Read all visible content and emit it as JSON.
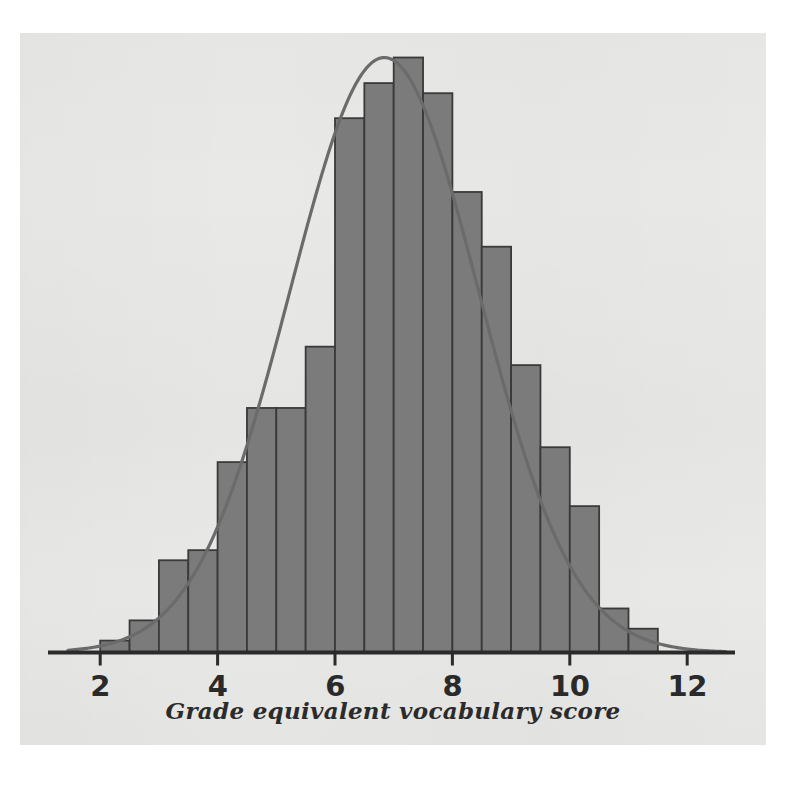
{
  "chart_data": {
    "type": "bar",
    "title": "",
    "subtitle": "",
    "xlabel": "Grade equivalent vocabulary score",
    "ylabel": "",
    "grid": false,
    "legend": null,
    "xlim": [
      1.45,
      12.6
    ],
    "ylim": [
      0,
      0.345
    ],
    "bin_width": 0.5,
    "x_ticks": [
      2,
      4,
      6,
      8,
      10,
      12
    ],
    "x_tick_labels": [
      "2",
      "4",
      "6",
      "8",
      "10",
      "12"
    ],
    "y_axis_visible": false,
    "bar_fill": "#7b7b7b",
    "bar_edge": "#3a3a3a",
    "curve_color": "#6b6b6b",
    "axis_color": "#2b2b2b",
    "plate_background": "#e9e9e7",
    "page_background": "#ffffff",
    "categories": [
      "2.0-2.5",
      "2.5-3.0",
      "3.0-3.5",
      "3.5-4.0",
      "4.0-4.5",
      "4.5-5.0",
      "5.0-5.5",
      "5.5-6.0",
      "6.0-6.5",
      "6.5-7.0",
      "7.0-7.5",
      "7.5-8.0",
      "8.0-8.5",
      "8.5-9.0",
      "9.0-9.5",
      "9.5-10.0",
      "10.0-10.5",
      "10.5-11.0",
      "11.0-11.5"
    ],
    "bin_edges": [
      2.0,
      2.5,
      3.0,
      3.5,
      4.0,
      4.5,
      5.0,
      5.5,
      6.0,
      6.5,
      7.0,
      7.5,
      8.0,
      8.5,
      9.0,
      9.5,
      10.0,
      10.5,
      11.0,
      11.5
    ],
    "values": [
      0.02,
      0.054,
      0.155,
      0.172,
      0.32,
      0.411,
      0.411,
      0.514,
      0.898,
      0.957,
      1.0,
      0.94,
      0.774,
      0.682,
      0.483,
      0.345,
      0.246,
      0.074,
      0.04
    ],
    "values_note": "bar heights normalized to tallest bin (6.5-7.0) = 1.000",
    "bar_heights_px": [
      12,
      32,
      92,
      102,
      190,
      244,
      244,
      305,
      534,
      569,
      595,
      559,
      460,
      405,
      287,
      205,
      146,
      44,
      24
    ],
    "overlay_curve": {
      "name": "normal-density-curve",
      "kind": "line",
      "mean": 6.84,
      "sigma": 1.61,
      "peak_value": 1.0,
      "description": "smooth bell-shaped normal curve fitted over the histogram"
    },
    "annotations": []
  },
  "axis": {
    "x_title": "Grade equivalent vocabulary score"
  },
  "ticks": [
    {
      "label": "2",
      "value": 2
    },
    {
      "label": "4",
      "value": 4
    },
    {
      "label": "6",
      "value": 6
    },
    {
      "label": "8",
      "value": 8
    },
    {
      "label": "10",
      "value": 10
    },
    {
      "label": "12",
      "value": 12
    }
  ]
}
